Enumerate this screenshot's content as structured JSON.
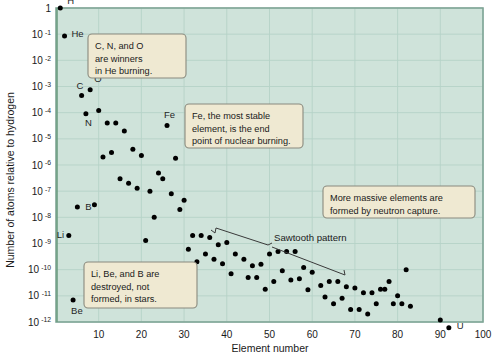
{
  "chart_data": {
    "type": "line",
    "title": "",
    "xlabel": "Element number",
    "ylabel": "Number of atoms relative to hydrogen",
    "xlim": [
      0,
      100
    ],
    "ylim": [
      1e-12,
      1
    ],
    "yscale": "log",
    "grid": true,
    "legend": "none",
    "x_ticks": [
      10,
      20,
      30,
      40,
      50,
      60,
      70,
      80,
      90,
      100
    ],
    "x_tick_labels": [
      "10",
      "20",
      "30",
      "40",
      "50",
      "60",
      "70",
      "80",
      "90",
      "100"
    ],
    "y_ticks": [
      1,
      0.1,
      0.01,
      0.001,
      0.0001,
      1e-05,
      1e-06,
      1e-07,
      1e-08,
      1e-09,
      1e-10,
      1e-11,
      1e-12
    ],
    "y_tick_labels": [
      "1",
      "10",
      "10",
      "10",
      "10",
      "10",
      "10",
      "10",
      "10",
      "10",
      "10",
      "10",
      "10"
    ],
    "y_tick_exponents": [
      "",
      "-1",
      "-2",
      "-3",
      "-4",
      "-5",
      "-6",
      "-7",
      "-8",
      "-9",
      "-10",
      "-11",
      "-12"
    ],
    "series_name": "Cosmic abundance relative to hydrogen",
    "marker": "circle",
    "marker_color": "#E8502A",
    "line_color": "#E8502A",
    "x": [
      1,
      2,
      3,
      4,
      5,
      6,
      7,
      8,
      9,
      10,
      11,
      12,
      13,
      14,
      15,
      16,
      17,
      18,
      19,
      20,
      21,
      22,
      23,
      24,
      25,
      26,
      27,
      28,
      29,
      30,
      31,
      32,
      33,
      34,
      35,
      36,
      37,
      38,
      39,
      40,
      41,
      42,
      44,
      45,
      46,
      47,
      48,
      49,
      50,
      51,
      52,
      53,
      54,
      55,
      56,
      57,
      58,
      59,
      60,
      62,
      63,
      64,
      65,
      66,
      67,
      68,
      69,
      70,
      71,
      72,
      73,
      74,
      75,
      76,
      77,
      78,
      79,
      80,
      81,
      82,
      83,
      90,
      92
    ],
    "values": [
      1.0,
      0.085,
      2e-09,
      7e-12,
      2.5e-08,
      0.00045,
      9e-05,
      0.00075,
      3e-08,
      0.00012,
      2e-06,
      4e-05,
      3e-06,
      4e-05,
      3e-07,
      2e-05,
      2e-07,
      4e-06,
      1.3e-07,
      2.3e-06,
      1.3e-09,
      1e-07,
      1e-08,
      5e-07,
      3e-07,
      3.2e-05,
      8e-08,
      1.8e-06,
      2e-08,
      4.5e-08,
      6e-10,
      2e-09,
      2e-10,
      2e-09,
      4e-10,
      1.7e-09,
      2.5e-10,
      9e-10,
      1.7e-10,
      1.1e-09,
      7e-11,
      4e-10,
      2.5e-10,
      5e-11,
      1.4e-10,
      5e-11,
      1.6e-10,
      1.8e-11,
      4e-10,
      3.5e-11,
      5e-10,
      9e-11,
      5e-10,
      4e-11,
      5e-10,
      4.5e-11,
      1.2e-10,
      1.7e-11,
      8e-11,
      2.5e-11,
      9e-12,
      3.5e-11,
      5e-12,
      3.5e-11,
      8e-12,
      2.2e-11,
      3e-12,
      2e-11,
      3e-12,
      1.3e-11,
      2e-12,
      1.3e-11,
      5e-12,
      1.8e-11,
      1.8e-11,
      3.5e-11,
      5e-12,
      1e-11,
      5e-12,
      1e-10,
      4e-12,
      1.2e-12,
      6e-13
    ],
    "point_labels": [
      {
        "element": "H",
        "x": 1,
        "y": 1.0
      },
      {
        "element": "He",
        "x": 2,
        "y": 0.085
      },
      {
        "element": "Li",
        "x": 3,
        "y": 2e-09
      },
      {
        "element": "Be",
        "x": 4,
        "y": 7e-12
      },
      {
        "element": "B",
        "x": 5,
        "y": 2.5e-08
      },
      {
        "element": "C",
        "x": 6,
        "y": 0.00045
      },
      {
        "element": "N",
        "x": 7,
        "y": 9e-05
      },
      {
        "element": "O",
        "x": 8,
        "y": 0.00075
      },
      {
        "element": "Fe",
        "x": 26,
        "y": 3.2e-05
      },
      {
        "element": "U",
        "x": 92,
        "y": 6e-13
      }
    ],
    "annotations": [
      {
        "id": "he-burning",
        "text_lines": [
          "C, N, and O",
          "are winners",
          "in He burning."
        ]
      },
      {
        "id": "fe-stable",
        "text_lines": [
          "Fe, the most stable",
          "element, is the end",
          "point of nuclear burning."
        ]
      },
      {
        "id": "neutron-capture",
        "text_lines": [
          "More massive elements are",
          "formed by neutron capture."
        ]
      },
      {
        "id": "light-destroyed",
        "text_lines": [
          "Li, Be, and B are",
          "destroyed, not",
          "formed, in stars."
        ]
      },
      {
        "id": "sawtooth",
        "text_lines": [
          "Sawtooth pattern"
        ]
      }
    ],
    "colors": {
      "plot_background": "#cfe3da",
      "grid": "#b6d2c7",
      "axis_border": "#7fa596",
      "data": "#E8502A",
      "callout_fill": "#efe9d2",
      "callout_border": "#8a8a7e",
      "leader_line": "#3a3a3a",
      "text": "#1a1a1a"
    }
  }
}
